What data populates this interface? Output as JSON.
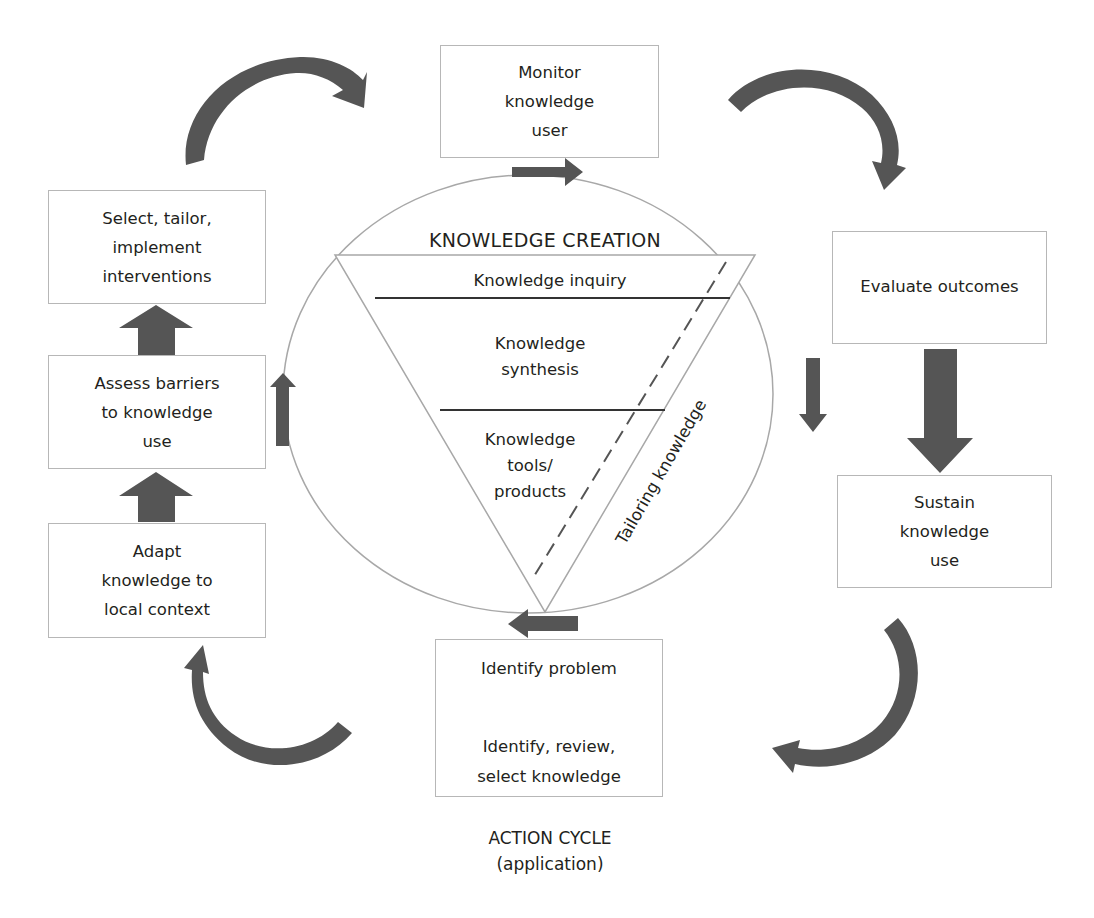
{
  "diagram": {
    "type": "knowledge-to-action framework",
    "colors": {
      "arrow": "#555555",
      "bidirectional_arrow": "#9b9b9b",
      "box_border": "#b7b7b7",
      "circle_line": "#a8a8a8",
      "text": "#231f20"
    },
    "knowledge_creation": {
      "title": "KNOWLEDGE CREATION",
      "levels": [
        "Knowledge inquiry",
        "Knowledge\nsynthesis",
        "Knowledge\ntools/\nproducts"
      ],
      "side_label": "Tailoring knowledge"
    },
    "action_cycle": {
      "title": "ACTION CYCLE\n(application)",
      "steps": {
        "monitor": "Monitor\nknowledge\nuser",
        "evaluate": "Evaluate outcomes",
        "sustain": "Sustain\nknowledge\nuse",
        "identify_problem": "Identify problem",
        "identify_review": "Identify, review,\nselect knowledge",
        "adapt": "Adapt\nknowledge to\nlocal context",
        "assess": "Assess barriers\nto knowledge\nuse",
        "select": "Select, tailor,\nimplement\ninterventions"
      }
    }
  }
}
